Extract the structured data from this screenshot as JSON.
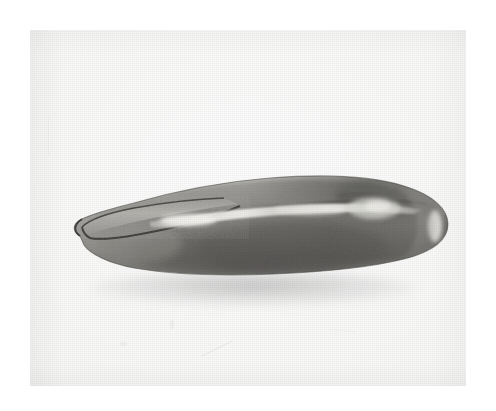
{
  "image": {
    "medium": "black-and-white photograph",
    "subject_name": "elongated carved implement",
    "subject_description": "Single elongated artifact photographed in profile on a plain pale background. The object tapers to a narrow pointed tip at the left where a hollowed oval cavity is visible, swells through a broad middle and terminates in a rounded bulbous end at the right. A long shallow groove with a bright specular highlight runs lengthwise just above the midline.",
    "orientation": "horizontal, tip to the left, rounded end to the right",
    "background_label": "plain pale studio background",
    "alt_text": "Black and white photograph of a long narrow carved object with a pointed hollowed left tip and a rounded right end, lying horizontally on a plain light background."
  },
  "colors": {
    "page_background": "#ffffff",
    "print_paper": "#f7f7f6",
    "object_light": "#b9b8b4",
    "object_mid": "#8e8d89",
    "object_dark": "#5e5d5a",
    "object_darkest": "#3f3e3c",
    "highlight": "#ededea",
    "cavity_interior": "#a7a6a2",
    "outline": "#2e2d2c",
    "shadow": "#9a9a98"
  },
  "regions": [
    {
      "name": "pointed-tip",
      "label": "Pointed left tip with hollowed oval cavity"
    },
    {
      "name": "cavity",
      "label": "Hollowed oval cavity / scooped recess"
    },
    {
      "name": "longitudinal-groove",
      "label": "Longitudinal groove with specular highlight"
    },
    {
      "name": "upper-ridge",
      "label": "Upper ridge / dorsal surface"
    },
    {
      "name": "lower-body",
      "label": "Lower body with dark mottled texture"
    },
    {
      "name": "rounded-end",
      "label": "Rounded bulbous right end"
    },
    {
      "name": "end-highlight",
      "label": "Crescent highlight on rounded end"
    },
    {
      "name": "cast-shadow",
      "label": "Soft cast shadow beneath object"
    }
  ],
  "geometry": {
    "canvas_width": 496,
    "canvas_height": 411,
    "print_left": 30,
    "print_top": 30,
    "print_width": 436,
    "print_height": 356,
    "object_left": 48,
    "object_right": 460,
    "object_top": 158,
    "object_bottom": 288
  }
}
